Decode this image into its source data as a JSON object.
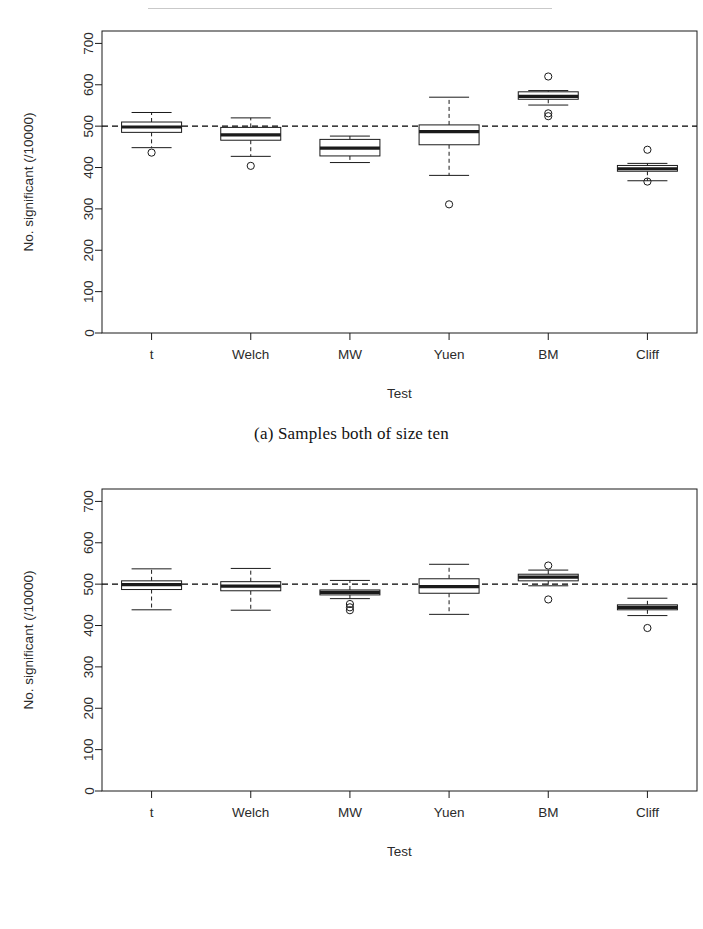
{
  "figure": {
    "panels": [
      {
        "id": "a",
        "caption": "(a) Samples both of size ten"
      },
      {
        "id": "b",
        "caption": "(b) Samples both of size thirty"
      }
    ]
  },
  "chart_data": [
    {
      "type": "box",
      "panel_id": "a",
      "title": "",
      "caption": "(a) Samples both of size ten",
      "xlabel": "Test",
      "ylabel": "No. significant (/10000)",
      "categories": [
        "t",
        "Welch",
        "MW",
        "Yuen",
        "BM",
        "Cliff"
      ],
      "ylim": [
        0,
        730
      ],
      "yticks": [
        0,
        100,
        200,
        300,
        400,
        500,
        600,
        700
      ],
      "ytick_labels": [
        "0",
        "100",
        "200",
        "300",
        "400",
        "500",
        "600",
        "700"
      ],
      "grid": false,
      "legend": "none",
      "reference_line": {
        "value": 500,
        "style": "dashed",
        "color": "#000000"
      },
      "boxes": [
        {
          "category": "t",
          "whisker_low": 448,
          "q1": 485,
          "median": 498,
          "q3": 510,
          "whisker_high": 533,
          "outliers": [
            436
          ]
        },
        {
          "category": "Welch",
          "whisker_low": 427,
          "q1": 466,
          "median": 479,
          "q3": 497,
          "whisker_high": 520,
          "outliers": [
            404
          ]
        },
        {
          "category": "MW",
          "whisker_low": 412,
          "q1": 428,
          "median": 447,
          "q3": 468,
          "whisker_high": 476,
          "outliers": []
        },
        {
          "category": "Yuen",
          "whisker_low": 381,
          "q1": 455,
          "median": 487,
          "q3": 503,
          "whisker_high": 570,
          "outliers": [
            311
          ]
        },
        {
          "category": "BM",
          "whisker_low": 551,
          "q1": 565,
          "median": 572,
          "q3": 583,
          "whisker_high": 586,
          "outliers": [
            620,
            531,
            524
          ]
        },
        {
          "category": "Cliff",
          "whisker_low": 368,
          "q1": 391,
          "median": 397,
          "q3": 405,
          "whisker_high": 410,
          "outliers": [
            443,
            366
          ]
        }
      ]
    },
    {
      "type": "box",
      "panel_id": "b",
      "title": "",
      "caption": "(b) Samples both of size thirty",
      "xlabel": "Test",
      "ylabel": "No. significant (/10000)",
      "categories": [
        "t",
        "Welch",
        "MW",
        "Yuen",
        "BM",
        "Cliff"
      ],
      "ylim": [
        0,
        730
      ],
      "yticks": [
        0,
        100,
        200,
        300,
        400,
        500,
        600,
        700
      ],
      "ytick_labels": [
        "0",
        "100",
        "200",
        "300",
        "400",
        "500",
        "600",
        "700"
      ],
      "grid": false,
      "legend": "none",
      "reference_line": {
        "value": 500,
        "style": "dashed",
        "color": "#000000"
      },
      "boxes": [
        {
          "category": "t",
          "whisker_low": 438,
          "q1": 487,
          "median": 499,
          "q3": 508,
          "whisker_high": 537,
          "outliers": []
        },
        {
          "category": "Welch",
          "whisker_low": 437,
          "q1": 484,
          "median": 495,
          "q3": 506,
          "whisker_high": 538,
          "outliers": []
        },
        {
          "category": "MW",
          "whisker_low": 465,
          "q1": 474,
          "median": 480,
          "q3": 486,
          "whisker_high": 509,
          "outliers": [
            452,
            444,
            437
          ]
        },
        {
          "category": "Yuen",
          "whisker_low": 427,
          "q1": 478,
          "median": 494,
          "q3": 513,
          "whisker_high": 548,
          "outliers": []
        },
        {
          "category": "BM",
          "whisker_low": 496,
          "q1": 508,
          "median": 517,
          "q3": 524,
          "whisker_high": 534,
          "outliers": [
            545,
            463
          ]
        },
        {
          "category": "Cliff",
          "whisker_low": 424,
          "q1": 438,
          "median": 444,
          "q3": 450,
          "whisker_high": 466,
          "outliers": [
            394
          ]
        }
      ]
    }
  ]
}
